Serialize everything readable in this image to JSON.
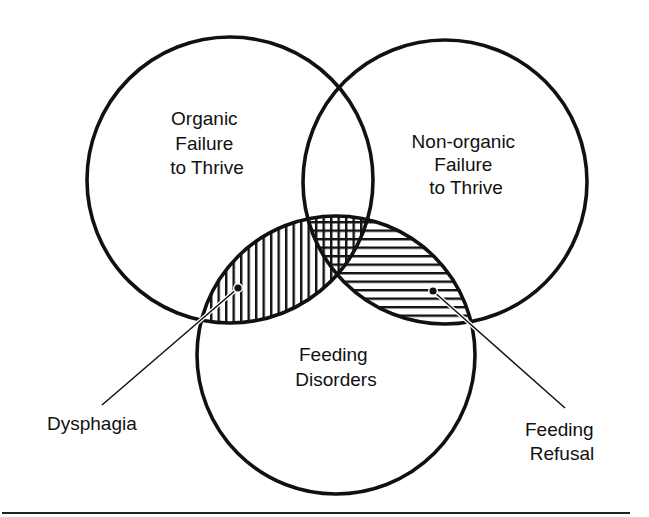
{
  "diagram": {
    "type": "venn",
    "circles": [
      {
        "id": "organic",
        "lines": [
          "Organic",
          "Failure",
          "to Thrive"
        ]
      },
      {
        "id": "nonorganic",
        "lines": [
          "Non-organic",
          "Failure",
          "to Thrive"
        ]
      },
      {
        "id": "feeding",
        "lines": [
          "Feeding",
          "Disorders"
        ]
      }
    ],
    "callouts": [
      {
        "id": "dysphagia",
        "lines": [
          "Dysphagia"
        ],
        "region": "Organic FTT ∩ Feeding Disorders",
        "hatch": "vertical"
      },
      {
        "id": "feeding-refusal",
        "lines": [
          "Feeding",
          "Refusal"
        ],
        "region": "Non-organic FTT ∩ Feeding Disorders",
        "hatch": "horizontal"
      }
    ],
    "triple_overlap_hatch": "crosshatch",
    "colors": {
      "ink": "#111111",
      "background": "#ffffff"
    }
  }
}
